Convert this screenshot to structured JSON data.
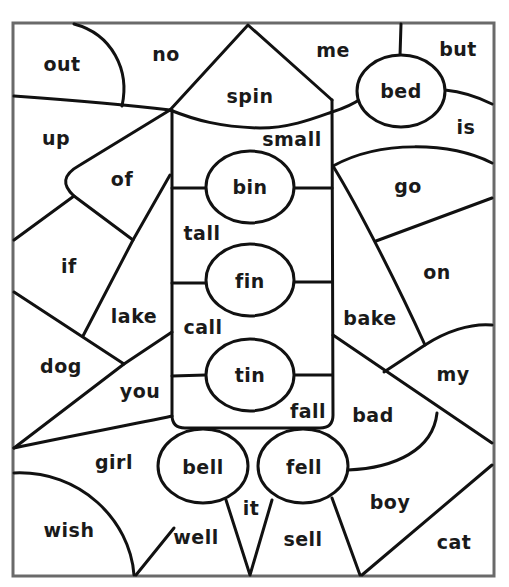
{
  "worksheet": {
    "frame_color": "#6a6a6a",
    "line_color": "#111111",
    "words": [
      {
        "id": "out",
        "text": "out",
        "x": 62,
        "y": 64
      },
      {
        "id": "no",
        "text": "no",
        "x": 166,
        "y": 54
      },
      {
        "id": "spin",
        "text": "spin",
        "x": 250,
        "y": 96
      },
      {
        "id": "me",
        "text": "me",
        "x": 333,
        "y": 50
      },
      {
        "id": "bed",
        "text": "bed",
        "x": 401,
        "y": 91
      },
      {
        "id": "but",
        "text": "but",
        "x": 458,
        "y": 49
      },
      {
        "id": "up",
        "text": "up",
        "x": 56,
        "y": 138
      },
      {
        "id": "small",
        "text": "small",
        "x": 292,
        "y": 139
      },
      {
        "id": "is",
        "text": "is",
        "x": 466,
        "y": 127
      },
      {
        "id": "of",
        "text": "of",
        "x": 122,
        "y": 179
      },
      {
        "id": "bin",
        "text": "bin",
        "x": 250,
        "y": 187
      },
      {
        "id": "go",
        "text": "go",
        "x": 408,
        "y": 186
      },
      {
        "id": "tall",
        "text": "tall",
        "x": 202,
        "y": 233
      },
      {
        "id": "if",
        "text": "if",
        "x": 69,
        "y": 266
      },
      {
        "id": "fin",
        "text": "fin",
        "x": 250,
        "y": 281
      },
      {
        "id": "on",
        "text": "on",
        "x": 437,
        "y": 272
      },
      {
        "id": "lake",
        "text": "lake",
        "x": 134,
        "y": 316
      },
      {
        "id": "call",
        "text": "call",
        "x": 203,
        "y": 327
      },
      {
        "id": "bake",
        "text": "bake",
        "x": 370,
        "y": 318
      },
      {
        "id": "dog",
        "text": "dog",
        "x": 61,
        "y": 366
      },
      {
        "id": "you",
        "text": "you",
        "x": 140,
        "y": 391
      },
      {
        "id": "tin",
        "text": "tin",
        "x": 250,
        "y": 375
      },
      {
        "id": "my",
        "text": "my",
        "x": 453,
        "y": 374
      },
      {
        "id": "fall",
        "text": "fall",
        "x": 308,
        "y": 411
      },
      {
        "id": "bad",
        "text": "bad",
        "x": 373,
        "y": 415
      },
      {
        "id": "girl",
        "text": "girl",
        "x": 114,
        "y": 462
      },
      {
        "id": "bell",
        "text": "bell",
        "x": 203,
        "y": 467
      },
      {
        "id": "fell",
        "text": "fell",
        "x": 304,
        "y": 467
      },
      {
        "id": "boy",
        "text": "boy",
        "x": 390,
        "y": 502
      },
      {
        "id": "it",
        "text": "it",
        "x": 251,
        "y": 508
      },
      {
        "id": "wish",
        "text": "wish",
        "x": 69,
        "y": 530
      },
      {
        "id": "well",
        "text": "well",
        "x": 196,
        "y": 537
      },
      {
        "id": "sell",
        "text": "sell",
        "x": 303,
        "y": 539
      },
      {
        "id": "cat",
        "text": "cat",
        "x": 454,
        "y": 542
      }
    ]
  }
}
